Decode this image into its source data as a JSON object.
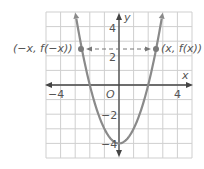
{
  "chart_data": {
    "type": "line",
    "title": "",
    "xlabel": "x",
    "ylabel": "y",
    "origin_label": "O",
    "xlim": [
      -5,
      5
    ],
    "ylim": [
      -5,
      5
    ],
    "grid": true,
    "x_tick_labels": [
      "-4",
      "4"
    ],
    "y_tick_labels": [
      "4",
      "2",
      "-2",
      "-4"
    ],
    "series": [
      {
        "name": "f(x) = x^2 - 4",
        "function": "x^2 - 4",
        "x": [
          -3,
          -2.5,
          -2,
          -1,
          0,
          1,
          2,
          2.5,
          3
        ],
        "y": [
          5,
          2.25,
          0,
          -3,
          -4,
          -3,
          0,
          2.25,
          5
        ]
      }
    ],
    "points": [
      {
        "label": "(−x, f(−x))",
        "x": -2.55,
        "y": 2.5
      },
      {
        "label": "(x, f(x))",
        "x": 2.55,
        "y": 2.5
      }
    ],
    "annotations": [
      "dashed double-headed arrow connecting (−x, f(−x)) and (x, f(x))"
    ],
    "colors": {
      "curve": "#8a8a8a",
      "axis": "#444444",
      "grid": "#cfcfcf",
      "text": "#555555"
    }
  },
  "labels": {
    "x_axis": "x",
    "y_axis": "y",
    "origin": "O",
    "x_neg4": "−4",
    "x_pos4": "4",
    "y_pos4": "4",
    "y_pos2": "2",
    "y_neg2": "−2",
    "y_neg4": "−4",
    "point_left": "(−x, f(−x))",
    "point_right": "(x, f(x))"
  }
}
